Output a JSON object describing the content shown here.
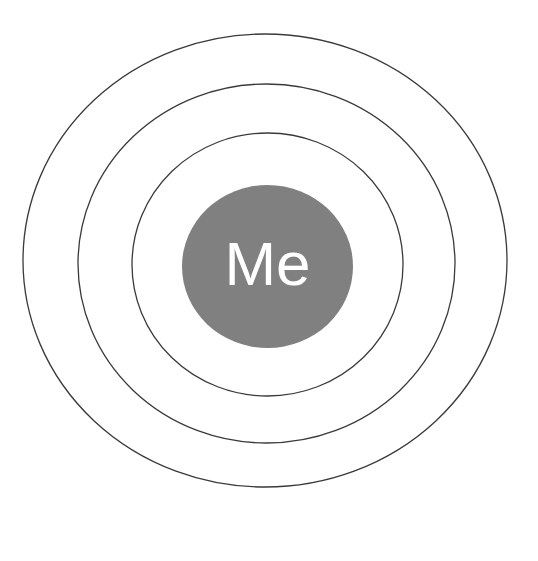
{
  "canvas": {
    "width": 538,
    "height": 561,
    "background_color": "#ffffff"
  },
  "diagram": {
    "type": "concentric-circles",
    "title_visible": false,
    "core": {
      "label": "Me",
      "fill_color": "#808080",
      "text_color": "#ffffff",
      "font_size": 62,
      "center_x": 267.5,
      "center_y": 266.5,
      "radius_x": 85.5,
      "radius_y": 81.5
    },
    "rings": [
      {
        "name": "inner-ring",
        "index": 1,
        "label": "",
        "stroke_color": "#3a3a3a",
        "stroke_width": 1.3,
        "fill": "none",
        "center_x": 267.5,
        "center_y": 264.5,
        "radius_x": 135.5,
        "radius_y": 131.5
      },
      {
        "name": "middle-ring",
        "index": 2,
        "label": "",
        "stroke_color": "#3a3a3a",
        "stroke_width": 1.3,
        "fill": "none",
        "center_x": 266.5,
        "center_y": 263.5,
        "radius_x": 188.5,
        "radius_y": 179.5
      },
      {
        "name": "outer-ring",
        "index": 3,
        "label": "",
        "stroke_color": "#3a3a3a",
        "stroke_width": 1.3,
        "fill": "none",
        "center_x": 265.0,
        "center_y": 260.5,
        "radius_x": 242.0,
        "radius_y": 226.5
      }
    ]
  }
}
